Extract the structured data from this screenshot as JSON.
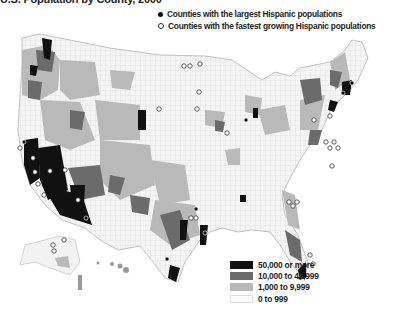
{
  "title": "U.S. Population by County, 2000",
  "marker_legend": [
    {
      "symbol": "filled-circle",
      "label": "Counties with the largest Hispanic populations"
    },
    {
      "symbol": "hollow-circle",
      "label": "Counties with the fastest growing Hispanic populations"
    }
  ],
  "choropleth_legend": [
    {
      "label": "50,000 or more",
      "color": "#111111"
    },
    {
      "label": "10,000 to 49,999",
      "color": "#6b6b6b"
    },
    {
      "label": "1,000 to 9,999",
      "color": "#b9b9b9"
    },
    {
      "label": "0 to 999",
      "color": "#ffffff"
    }
  ],
  "map": {
    "subject": "Hispanic population by U.S. county",
    "insets": [
      "Alaska",
      "Hawaii"
    ]
  }
}
